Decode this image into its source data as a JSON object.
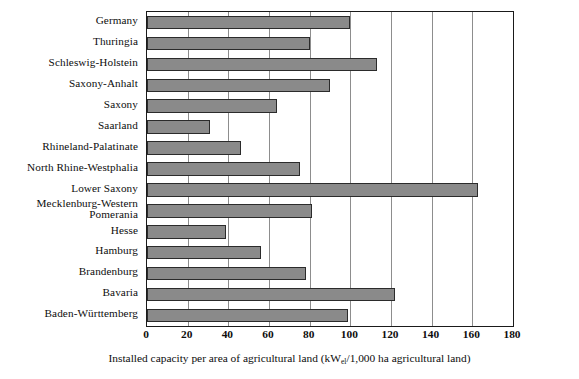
{
  "chart_data": {
    "type": "bar",
    "orientation": "horizontal",
    "title": "",
    "xlabel": "Installed capacity per area of agricultural land (kWel/1,000 ha agricultural land)",
    "xlabel_prefix": "Installed capacity per area of agricultural land (kW",
    "xlabel_subscript": "el",
    "xlabel_suffix": "/1,000 ha agricultural land)",
    "ylabel": "",
    "xlim": [
      0,
      180
    ],
    "xticks": [
      0,
      20,
      40,
      60,
      80,
      100,
      120,
      140,
      160,
      180
    ],
    "xtick_labels": [
      "0",
      "20",
      "40",
      "60",
      "80",
      "100",
      "120",
      "140",
      "160",
      "180"
    ],
    "grid": "vertical",
    "legend": "none",
    "bar_color": "#8a8a8a",
    "bar_edge_color": "#2b2b2b",
    "frame_color": "#1a1a1a",
    "gridline_color": "#8d8d8d",
    "categories": [
      "Germany",
      "Thuringia",
      "Schleswig-Holstein",
      "Saxony-Anhalt",
      "Saxony",
      "Saarland",
      "Rhineland-Palatinate",
      "North Rhine-Westphalia",
      "Lower Saxony",
      "Mecklenburg-Western\nPomerania",
      "Hesse",
      "Hamburg",
      "Brandenburg",
      "Bavaria",
      "Baden-Württemberg"
    ],
    "values": [
      100,
      80,
      113,
      90,
      64,
      31,
      46,
      75,
      163,
      81,
      39,
      56,
      78,
      122,
      99
    ]
  }
}
